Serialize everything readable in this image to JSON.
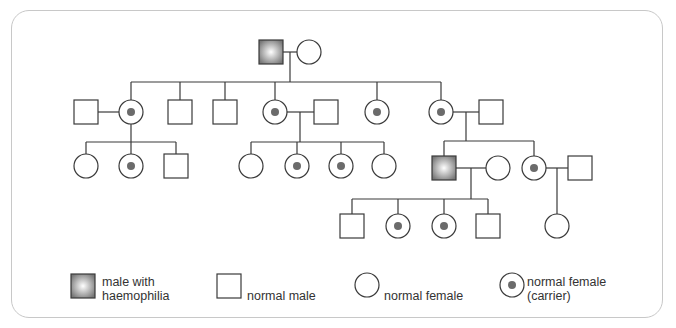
{
  "diagram": {
    "type": "pedigree",
    "topic": "haemophilia inheritance",
    "colors": {
      "line": "#3a3a3a",
      "affected_fill_outer": "#7a7a7a",
      "affected_fill_inner": "#ffffff",
      "carrier_dot": "#6b6b6b",
      "frame_border": "#c8c8c8"
    },
    "generations": [
      {
        "id": "I",
        "members": [
          "male with haemophilia",
          "normal female"
        ]
      },
      {
        "id": "II",
        "members": [
          "normal male (spouse)",
          "normal female (carrier)",
          "normal male",
          "normal male",
          "normal female (carrier)",
          "normal male (spouse)",
          "normal female (carrier)",
          "normal female (carrier)",
          "normal male (spouse)"
        ]
      },
      {
        "id": "III",
        "members": [
          "normal female",
          "normal female (carrier)",
          "normal male",
          "normal female",
          "normal female (carrier)",
          "normal female (carrier)",
          "normal female",
          "male with haemophilia",
          "normal female (spouse)",
          "normal female (carrier)",
          "normal male (spouse)"
        ]
      },
      {
        "id": "IV",
        "members": [
          "normal male",
          "normal female (carrier)",
          "normal female (carrier)",
          "normal male",
          "normal female"
        ]
      }
    ]
  },
  "legend": {
    "affected_male": {
      "line1": "male with",
      "line2": "haemophilia"
    },
    "normal_male": "normal male",
    "normal_female": "normal female",
    "carrier_female": {
      "line1": "normal female",
      "line2": "(carrier)"
    }
  }
}
